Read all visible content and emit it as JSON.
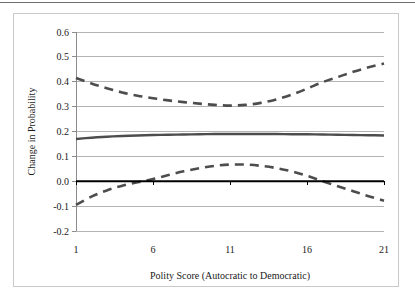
{
  "figure": {
    "background_color": "#ffffff",
    "frame_color": "#c9c9c9",
    "top_rule_color": "#6f6f6f"
  },
  "chart_data": {
    "type": "line",
    "title": "",
    "subtitle": "",
    "xlabel": "Polity Score (Autocratic to Democratic)",
    "ylabel": "Change in Probability",
    "xlim": [
      1,
      21
    ],
    "ylim": [
      -0.2,
      0.6
    ],
    "xticks": [
      1,
      6,
      11,
      16,
      21
    ],
    "xtick_labels": [
      "1",
      "6",
      "11",
      "16",
      "21"
    ],
    "yticks": [
      -0.2,
      -0.1,
      0.0,
      0.1,
      0.2,
      0.3,
      0.4,
      0.5,
      0.6
    ],
    "ytick_labels": [
      "-0.2",
      "-0.1",
      "0.0",
      "0.1",
      "0.2",
      "0.3",
      "0.4",
      "0.5",
      "0.6"
    ],
    "grid": "horizontal",
    "grid_color": "#b3b3b3",
    "legend": "none",
    "legend_position": "none",
    "x": [
      1,
      2,
      3,
      4,
      5,
      6,
      7,
      8,
      9,
      10,
      11,
      12,
      13,
      14,
      15,
      16,
      17,
      18,
      19,
      20,
      21
    ],
    "series": [
      {
        "name": "Upper 95% Confidence Bound",
        "style": "dashed",
        "color": "#4d4d4d",
        "width": 2.6,
        "values": [
          0.415,
          0.393,
          0.374,
          0.357,
          0.344,
          0.334,
          0.325,
          0.318,
          0.312,
          0.307,
          0.304,
          0.307,
          0.315,
          0.329,
          0.348,
          0.372,
          0.398,
          0.419,
          0.44,
          0.458,
          0.473
        ]
      },
      {
        "name": "Predicted Change in Probability",
        "style": "solid",
        "color": "#4d4d4d",
        "width": 2.4,
        "values": [
          0.17,
          0.175,
          0.179,
          0.182,
          0.184,
          0.186,
          0.187,
          0.188,
          0.189,
          0.19,
          0.19,
          0.19,
          0.19,
          0.19,
          0.189,
          0.189,
          0.188,
          0.187,
          0.186,
          0.185,
          0.184
        ]
      },
      {
        "name": "Lower 95% Confidence Bound",
        "style": "dashed",
        "color": "#4d4d4d",
        "width": 2.6,
        "values": [
          -0.095,
          -0.062,
          -0.037,
          -0.018,
          -0.004,
          0.009,
          0.025,
          0.04,
          0.052,
          0.062,
          0.067,
          0.067,
          0.062,
          0.053,
          0.04,
          0.022,
          0.0,
          -0.02,
          -0.04,
          -0.06,
          -0.078
        ]
      },
      {
        "name": "Zero Reference Line",
        "style": "solid",
        "color": "#000000",
        "width": 2.0,
        "values": [
          0,
          0,
          0,
          0,
          0,
          0,
          0,
          0,
          0,
          0,
          0,
          0,
          0,
          0,
          0,
          0,
          0,
          0,
          0,
          0,
          0
        ]
      }
    ]
  }
}
